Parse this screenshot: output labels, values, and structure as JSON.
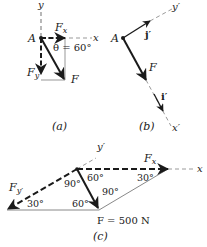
{
  "figure": {
    "panel_a": {
      "caption": "(a)",
      "labels": {
        "y_axis": "y",
        "x_axis": "x",
        "point": "A",
        "fx": "F",
        "fx_sub": "x",
        "fy": "F",
        "fy_sub": "y",
        "force": "F",
        "angle": "θ = 60°"
      }
    },
    "panel_b": {
      "caption": "(b)",
      "labels": {
        "y_prime_axis": "y′",
        "x_prime_axis": "x′",
        "point": "A",
        "j_prime": "j′",
        "i_prime": "i′",
        "force": "F"
      }
    },
    "panel_c": {
      "caption": "(c)",
      "labels": {
        "y_prime_axis": "y′",
        "x_axis": "x",
        "fx": "F",
        "fx_sub": "x",
        "fy_prime": "F",
        "fy_prime_sub": "y′",
        "force_value": "F = 500 N",
        "angle_90_top": "90°",
        "angle_60_top": "60°",
        "angle_30_right": "30°",
        "angle_90_right": "90°",
        "angle_30_left": "30°",
        "angle_60_bottom": "60°"
      }
    },
    "colors": {
      "ink": "#1a1a1a",
      "dash_light": "#9a9a9a",
      "thin_line": "#6a6a6a"
    }
  }
}
